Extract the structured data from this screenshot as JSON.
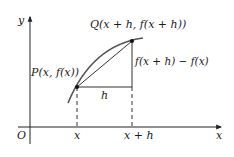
{
  "diagram": {
    "type": "derivative-secant-diagram",
    "axes": {
      "x_label": "x",
      "y_label": "y",
      "origin_label": "O"
    },
    "points": {
      "P": {
        "label": "P(x, f(x))"
      },
      "Q": {
        "label": "Q(x + h, f(x + h))"
      }
    },
    "tick_labels": {
      "x": "x",
      "x_plus_h": "x + h"
    },
    "segments": {
      "horizontal": "h",
      "vertical": "f(x + h) − f(x)"
    },
    "colors": {
      "axis": "#222222",
      "curve": "#555555",
      "secant": "#333333",
      "text": "#1a1a1a",
      "background": "#ffffff"
    }
  }
}
